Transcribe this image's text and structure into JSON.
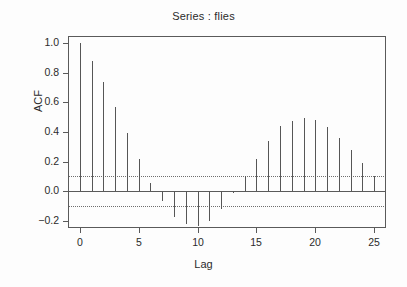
{
  "chart_data": {
    "type": "bar",
    "title": "Series : flies",
    "xlabel": "Lag",
    "ylabel": "ACF",
    "grid": false,
    "legend": null,
    "xlim": [
      -1,
      26
    ],
    "ylim": [
      -0.25,
      1.05
    ],
    "x_ticks": [
      0,
      5,
      10,
      15,
      20,
      25
    ],
    "x_tick_labels": [
      "0",
      "5",
      "10",
      "15",
      "20",
      "25"
    ],
    "y_ticks": [
      1.0,
      0.8,
      0.6,
      0.4,
      0.2,
      0.0,
      -0.2
    ],
    "y_tick_labels": [
      "1.0",
      "0.8",
      "0.6",
      "0.4",
      "0.2",
      "0.0",
      "-0.2"
    ],
    "confidence_bounds": [
      0.1,
      -0.1
    ],
    "confidence_style": "dotted",
    "categories": [
      0,
      1,
      2,
      3,
      4,
      5,
      6,
      7,
      8,
      9,
      10,
      11,
      12,
      13,
      14,
      15,
      16,
      17,
      18,
      19,
      20,
      21,
      22,
      23,
      24,
      25
    ],
    "values": [
      1.0,
      0.88,
      0.74,
      0.57,
      0.395,
      0.215,
      0.055,
      -0.07,
      -0.175,
      -0.225,
      -0.235,
      -0.205,
      -0.125,
      -0.015,
      0.105,
      0.22,
      0.34,
      0.44,
      0.475,
      0.495,
      0.48,
      0.435,
      0.36,
      0.275,
      0.19,
      0.1
    ]
  }
}
